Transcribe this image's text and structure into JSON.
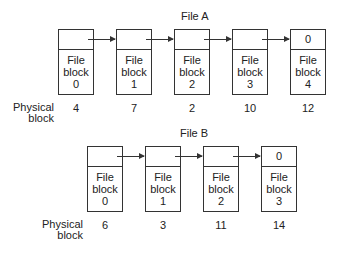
{
  "files": [
    {
      "title": "File A",
      "physical_label_line1": "Physical",
      "physical_label_line2": "block",
      "blocks": [
        {
          "pointer": "",
          "line1": "File",
          "line2": "block",
          "index": "0",
          "physical": "4"
        },
        {
          "pointer": "",
          "line1": "File",
          "line2": "block",
          "index": "1",
          "physical": "7"
        },
        {
          "pointer": "",
          "line1": "File",
          "line2": "block",
          "index": "2",
          "physical": "2"
        },
        {
          "pointer": "",
          "line1": "File",
          "line2": "block",
          "index": "3",
          "physical": "10"
        },
        {
          "pointer": "0",
          "line1": "File",
          "line2": "block",
          "index": "4",
          "physical": "12"
        }
      ]
    },
    {
      "title": "File B",
      "physical_label_line1": "Physical",
      "physical_label_line2": "block",
      "blocks": [
        {
          "pointer": "",
          "line1": "File",
          "line2": "block",
          "index": "0",
          "physical": "6"
        },
        {
          "pointer": "",
          "line1": "File",
          "line2": "block",
          "index": "1",
          "physical": "3"
        },
        {
          "pointer": "",
          "line1": "File",
          "line2": "block",
          "index": "2",
          "physical": "11"
        },
        {
          "pointer": "0",
          "line1": "File",
          "line2": "block",
          "index": "3",
          "physical": "14"
        }
      ]
    }
  ]
}
